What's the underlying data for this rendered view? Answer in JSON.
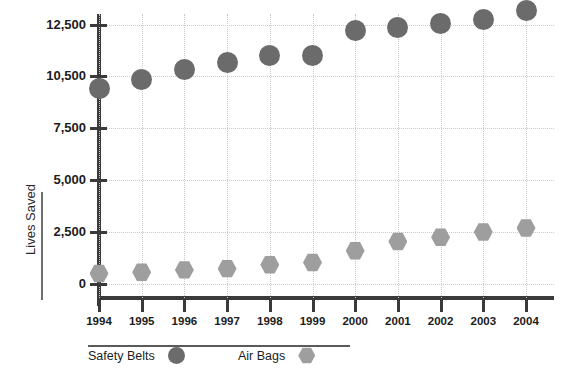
{
  "chart_data": {
    "type": "scatter",
    "title": "",
    "xlabel": "",
    "ylabel": "Lives Saved",
    "categories": [
      "1994",
      "1995",
      "1996",
      "1997",
      "1998",
      "1999",
      "2000",
      "2001",
      "2002",
      "2003",
      "2004"
    ],
    "series": [
      {
        "name": "Safety Belts",
        "marker": "circle",
        "color": "#6b6b6b",
        "values": [
          9800,
          10300,
          10750,
          11050,
          11300,
          11300,
          12250,
          12400,
          12550,
          12700,
          13050
        ]
      },
      {
        "name": "Air Bags",
        "marker": "hexagon",
        "color": "#9e9e9e",
        "values": [
          500,
          560,
          680,
          740,
          930,
          1040,
          1600,
          2050,
          2250,
          2500,
          2700
        ]
      }
    ],
    "ytick_labels": [
      "0",
      "2,500",
      "5,000",
      "7,500",
      "10,500",
      "12,500"
    ],
    "ytick_values": [
      0,
      2500,
      5000,
      7500,
      10500,
      12500
    ],
    "ylim": [
      0,
      13500
    ],
    "grid": "dotted-both",
    "legend_position": "bottom"
  },
  "axis": {
    "y_title": "Lives Saved"
  },
  "legend": {
    "items": [
      {
        "label": "Safety Belts",
        "marker": "circle",
        "color": "#6b6b6b"
      },
      {
        "label": "Air Bags",
        "marker": "hexagon",
        "color": "#9e9e9e"
      }
    ]
  },
  "colors": {
    "safety_belts": "#6b6b6b",
    "air_bags": "#9e9e9e",
    "axis": "#3a3a3a",
    "grid": "#c9c9c9",
    "background": "#ffffff"
  }
}
